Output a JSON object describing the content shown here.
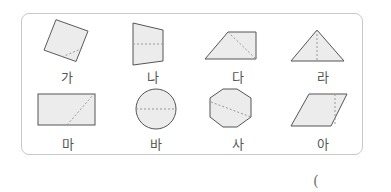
{
  "figure": {
    "shapes": [
      {
        "id": "ga",
        "label": "가",
        "shape": "square rotated, dashed line from corner region toward side"
      },
      {
        "id": "na",
        "label": "나",
        "shape": "trapezoid (vertical), dashed horizontal center line"
      },
      {
        "id": "da",
        "label": "다",
        "shape": "right trapezoid, dashed diagonal"
      },
      {
        "id": "ra",
        "label": "라",
        "shape": "isosceles triangle, dashed vertical height"
      },
      {
        "id": "ma",
        "label": "마",
        "shape": "rectangle, dashed diagonal segment"
      },
      {
        "id": "ba",
        "label": "바",
        "shape": "circle, dashed horizontal diameter"
      },
      {
        "id": "sa",
        "label": "사",
        "shape": "regular octagon, dashed diagonal"
      },
      {
        "id": "a",
        "label": "아",
        "shape": "parallelogram, dashed vertical line"
      }
    ],
    "answer_paren": "("
  },
  "colors": {
    "stroke": "#555555",
    "fill": "#ececec",
    "dash": "#999999",
    "border": "#c8c8c8"
  }
}
